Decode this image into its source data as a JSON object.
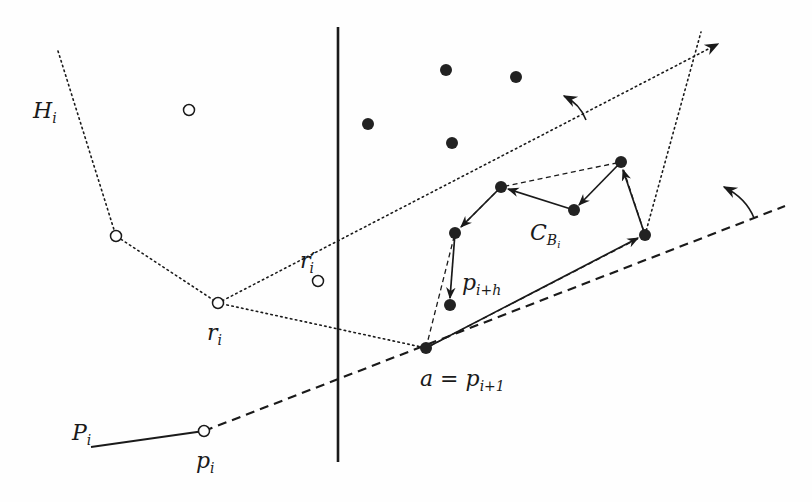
{
  "figure": {
    "colors": {
      "ink": "#1a1a1a",
      "background": "#fefefe"
    },
    "vertical_line": {
      "x": 338,
      "y1": 27,
      "y2": 462
    },
    "hollow_points": [
      {
        "id": "h-top",
        "x": 189,
        "y": 110
      },
      {
        "id": "h-left",
        "x": 116,
        "y": 236
      },
      {
        "id": "r_i",
        "x": 218,
        "y": 303
      },
      {
        "id": "r_i_prime",
        "x": 318,
        "y": 281
      },
      {
        "id": "p_i",
        "x": 204,
        "y": 431
      }
    ],
    "filled_points": [
      {
        "id": "f1",
        "x": 446,
        "y": 70
      },
      {
        "id": "f2",
        "x": 516,
        "y": 77
      },
      {
        "id": "f3",
        "x": 368,
        "y": 124
      },
      {
        "id": "f4",
        "x": 452,
        "y": 143
      },
      {
        "id": "a",
        "x": 426,
        "y": 348
      },
      {
        "id": "c-right",
        "x": 645,
        "y": 235
      },
      {
        "id": "c-top",
        "x": 621,
        "y": 162
      },
      {
        "id": "c-mid",
        "x": 574,
        "y": 210
      },
      {
        "id": "c-upper-left",
        "x": 501,
        "y": 187
      },
      {
        "id": "c-left",
        "x": 455,
        "y": 233
      },
      {
        "id": "p_i_plus_h",
        "x": 450,
        "y": 305
      }
    ],
    "labels": {
      "H_i": {
        "base": "H",
        "sub": "i"
      },
      "r_i": {
        "base": "r",
        "sub": "i"
      },
      "r_i_prime": {
        "base": "r",
        "prime": "′",
        "sub": "i"
      },
      "P_i": {
        "base": "P",
        "sub": "i"
      },
      "p_i": {
        "base": "p",
        "sub": "i"
      },
      "a_eq": {
        "lhs": "a",
        "eq": " = ",
        "base": "p",
        "sub": "i+1"
      },
      "p_i_plus_h": {
        "base": "p",
        "sub": "i+h"
      },
      "C_B_i": {
        "base": "C",
        "sub": "B",
        "subsub": "i"
      }
    }
  }
}
